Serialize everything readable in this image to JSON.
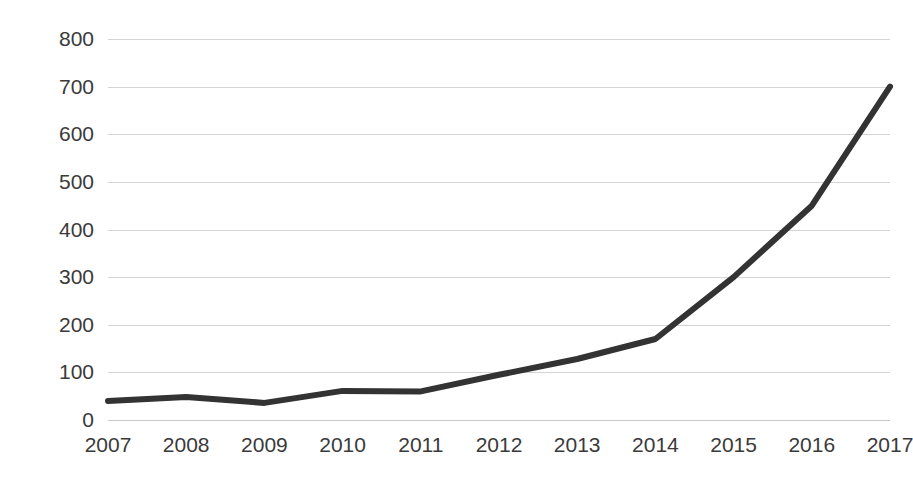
{
  "chart_data": {
    "type": "line",
    "title": "",
    "subtitle": "",
    "xlabel": "",
    "ylabel": "",
    "categories": [
      "2007",
      "2008",
      "2009",
      "2010",
      "2011",
      "2012",
      "2013",
      "2014",
      "2015",
      "2016",
      "2017"
    ],
    "values": [
      40,
      48,
      36,
      61,
      60,
      95,
      128,
      170,
      300,
      450,
      700
    ],
    "series": [
      {
        "name": "series-1",
        "values": [
          40,
          48,
          36,
          61,
          60,
          95,
          128,
          170,
          300,
          450,
          700
        ],
        "color": "#333333"
      }
    ],
    "ylim": [
      0,
      800
    ],
    "ytick_labels": [
      "800",
      "700",
      "600",
      "500",
      "400",
      "300",
      "200",
      "100",
      "0"
    ],
    "ytick_values": [
      800,
      700,
      600,
      500,
      400,
      300,
      200,
      100,
      0
    ],
    "ytick_step": 100,
    "grid": true,
    "grid_color": "#d4d4d4",
    "legend": false,
    "legend_position": "none",
    "annotations": [],
    "line_color": "#333333",
    "line_width": 6,
    "markers": false
  }
}
